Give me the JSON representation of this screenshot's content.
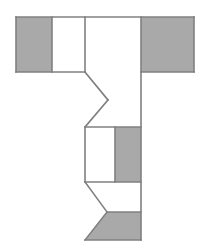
{
  "figure": {
    "canvas": {
      "width": 209,
      "height": 252,
      "background": "#ffffff"
    },
    "colors": {
      "shaded_fill": "#a9a9a9",
      "unshaded_fill": "#ffffff",
      "stroke": "#808080",
      "stroke_width": 1.6
    },
    "regions": [
      {
        "name": "top-left-shaded-block",
        "label": "shaded",
        "fill": "#a9a9a9",
        "points": "16,17 52,17 52,72 16,72"
      },
      {
        "name": "top-left-white-block",
        "label": "unshaded",
        "fill": "#ffffff",
        "points": "52,17 85,17 85,72 52,72"
      },
      {
        "name": "top-middle-white-block",
        "label": "unshaded",
        "fill": "#ffffff",
        "points": "85,17 141,17 141,72 85,72"
      },
      {
        "name": "top-right-shaded-block",
        "label": "shaded",
        "fill": "#a9a9a9",
        "points": "141,17 194,17 194,72 141,72"
      },
      {
        "name": "stem-zigzag-white-region",
        "label": "unshaded",
        "fill": "#ffffff",
        "points": "85,72 108,100 85,127 141,127 141,72"
      },
      {
        "name": "mid-left-white-block",
        "label": "unshaded",
        "fill": "#ffffff",
        "points": "85,127 115,127 115,182 85,182"
      },
      {
        "name": "mid-right-shaded-block",
        "label": "shaded",
        "fill": "#a9a9a9",
        "points": "115,127 141,127 141,182 115,182"
      },
      {
        "name": "bottom-chevron-white-region",
        "label": "unshaded",
        "fill": "#ffffff",
        "points": "85,182 141,182 141,212 107,212"
      },
      {
        "name": "bottom-chevron-shaded-region",
        "label": "shaded",
        "fill": "#a9a9a9",
        "points": "107,212 141,212 141,240 85,240"
      }
    ],
    "edges": [
      {
        "name": "top-bar-top-edge",
        "points": "16,17 194,17"
      },
      {
        "name": "top-bar-bottom-left-edge",
        "points": "16,72 85,72"
      },
      {
        "name": "top-bar-bottom-right-edge",
        "points": "141,72 194,72"
      },
      {
        "name": "top-bar-left-edge",
        "points": "16,17 16,72"
      },
      {
        "name": "top-bar-right-edge",
        "points": "194,17 194,72"
      },
      {
        "name": "shaded-divider-top-left",
        "points": "52,17 52,72"
      },
      {
        "name": "column-divider-top-middle",
        "points": "85,17 85,72"
      },
      {
        "name": "stem-right-long-edge",
        "points": "141,17 141,240"
      },
      {
        "name": "zigzag-upper-cut",
        "points": "85,72 108,100"
      },
      {
        "name": "zigzag-lower-cut",
        "points": "108,100 85,127"
      },
      {
        "name": "mid-box-top-edge",
        "points": "85,127 141,127"
      },
      {
        "name": "mid-box-left-edge",
        "points": "85,127 85,182"
      },
      {
        "name": "mid-box-bottom-edge",
        "points": "85,182 141,182"
      },
      {
        "name": "mid-shaded-divider",
        "points": "115,127 115,182"
      },
      {
        "name": "chevron-upper-cut",
        "points": "85,182 107,212"
      },
      {
        "name": "chevron-lower-cut",
        "points": "107,212 85,240"
      },
      {
        "name": "bottom-edge",
        "points": "85,240 141,240"
      },
      {
        "name": "bottom-shaded-divider",
        "points": "107,212 141,212"
      }
    ]
  }
}
